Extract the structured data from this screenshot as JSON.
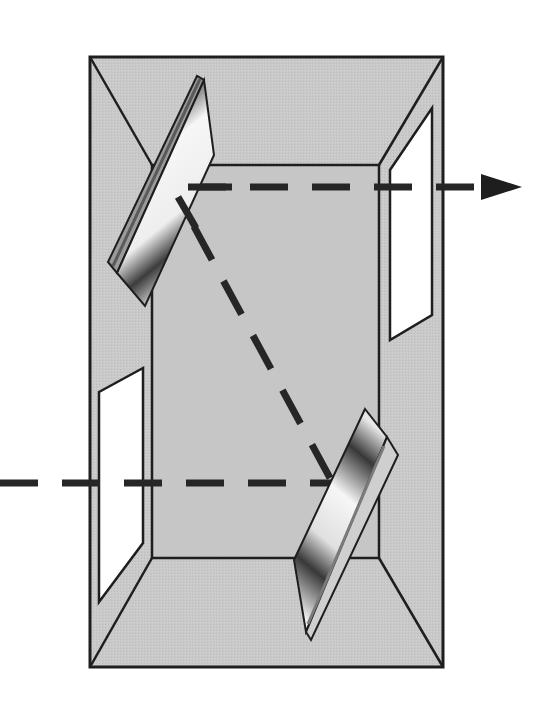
{
  "diagram": {
    "description": "Optical cell with two angled mirrors and two windows; a dashed light beam enters from the left, reflects off the bottom mirror, travels diagonally to the top mirror, and exits to the right",
    "colors": {
      "background": "#ffffff",
      "box_fill": "#c8c8c8",
      "back_wall_fill": "#c4c4c4",
      "outline": "#1e1e1e",
      "window_fill": "#ffffff",
      "beam": "#262626",
      "mirror_dark": "#3a3a3a",
      "mirror_light": "#f4f4f4"
    },
    "components": [
      {
        "id": "outer-box",
        "label": "Enclosure"
      },
      {
        "id": "back-wall",
        "label": "Back wall"
      },
      {
        "id": "entrance-window",
        "label": "Entrance window (left)"
      },
      {
        "id": "exit-window",
        "label": "Exit window (right)"
      },
      {
        "id": "mirror-bottom",
        "label": "Lower mirror"
      },
      {
        "id": "mirror-top",
        "label": "Upper mirror"
      },
      {
        "id": "beam-in",
        "label": "Incoming beam"
      },
      {
        "id": "beam-diagonal",
        "label": "Reflected beam"
      },
      {
        "id": "beam-out",
        "label": "Outgoing beam"
      },
      {
        "id": "arrow-head",
        "label": "Beam direction arrow"
      }
    ]
  }
}
